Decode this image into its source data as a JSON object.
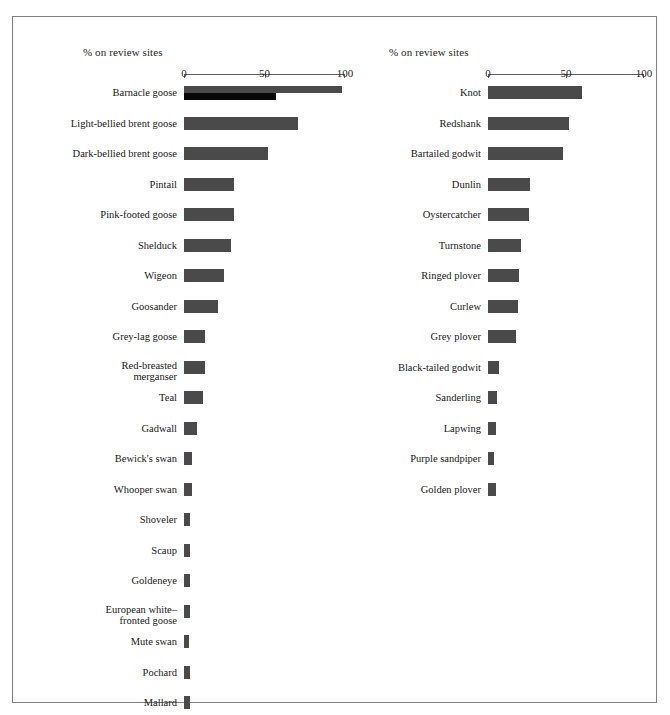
{
  "figure": {
    "background_color": "#ffffff",
    "frame_color": "#7d7d7d",
    "bar_color": "#4a4a4a",
    "bar_secondary_color": "#070707"
  },
  "panels": {
    "left": {
      "axis_title": "% on review sites",
      "tick_labels": [
        "0",
        "50",
        "100"
      ]
    },
    "right": {
      "axis_title": "% on review sites",
      "tick_labels": [
        "0",
        "50",
        "100"
      ]
    }
  },
  "chart_data": [
    {
      "type": "bar",
      "orientation": "horizontal",
      "panel": "left",
      "title": "% on review sites",
      "xlabel": "% on review sites",
      "ylabel": "",
      "xlim": [
        0,
        100
      ],
      "xticks": [
        0,
        50,
        100
      ],
      "grid": false,
      "legend": "none",
      "categories": [
        "Barnacle goose",
        "Light-bellied brent goose",
        "Dark-bellied brent goose",
        "Pintail",
        "Pink-footed goose",
        "Shelduck",
        "Wigeon",
        "Goosander",
        "Grey-lag goose",
        "Red-breasted\nmerganser",
        "Teal",
        "Gadwall",
        "Bewick's swan",
        "Whooper swan",
        "Shoveler",
        "Scaup",
        "Goldeneye",
        "European white–\nfronted goose",
        "Mute swan",
        "Pochard",
        "Mallard"
      ],
      "values": [
        98,
        71,
        52,
        31,
        31,
        29,
        25,
        21,
        13,
        13,
        12,
        8,
        5,
        5,
        4,
        4,
        4,
        4,
        3,
        4,
        4
      ],
      "series": [
        {
          "name": "% on review sites",
          "values": [
            98,
            71,
            52,
            31,
            31,
            29,
            25,
            21,
            13,
            13,
            12,
            8,
            5,
            5,
            4,
            4,
            4,
            4,
            3,
            4,
            4
          ]
        },
        {
          "name": "Barnacle goose second (darker) bar",
          "values": [
            57,
            null,
            null,
            null,
            null,
            null,
            null,
            null,
            null,
            null,
            null,
            null,
            null,
            null,
            null,
            null,
            null,
            null,
            null,
            null,
            null
          ]
        }
      ]
    },
    {
      "type": "bar",
      "orientation": "horizontal",
      "panel": "right",
      "title": "% on review sites",
      "xlabel": "% on review sites",
      "ylabel": "",
      "xlim": [
        0,
        100
      ],
      "xticks": [
        0,
        50,
        100
      ],
      "grid": false,
      "legend": "none",
      "categories": [
        "Knot",
        "Redshank",
        "Bartailed godwit",
        "Dunlin",
        "Oystercatcher",
        "Turnstone",
        "Ringed plover",
        "Curlew",
        "Grey plover",
        "Black-tailed godwit",
        "Sanderling",
        "Lapwing",
        "Purple sandpiper",
        "Golden plover"
      ],
      "values": [
        60,
        52,
        48,
        27,
        26,
        21,
        20,
        19,
        18,
        7,
        6,
        5,
        4,
        5
      ]
    }
  ]
}
